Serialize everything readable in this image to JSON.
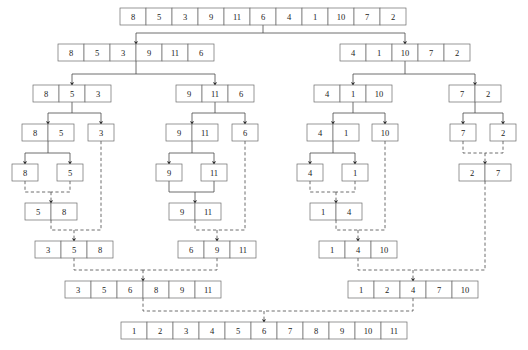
{
  "diagram": {
    "colors": {
      "box_stroke": "#6b6b6b",
      "line": "#4a4a4a",
      "text": "#1a1a1a",
      "background": "#ffffff"
    },
    "cell_width": 26,
    "cell_height": 17,
    "legend": {
      "split_style": "solid",
      "merge_style": "dashed"
    },
    "nodes": [
      {
        "id": "root",
        "phase": "split",
        "row": 0,
        "x": 120,
        "y": 8,
        "values": [
          8,
          5,
          3,
          9,
          11,
          6,
          4,
          1,
          10,
          7,
          2
        ]
      },
      {
        "id": "L",
        "phase": "split",
        "row": 1,
        "x": 58,
        "y": 44,
        "values": [
          8,
          5,
          3,
          9,
          11,
          6
        ]
      },
      {
        "id": "R",
        "phase": "split",
        "row": 1,
        "x": 340,
        "y": 44,
        "values": [
          4,
          1,
          10,
          7,
          2
        ]
      },
      {
        "id": "LL",
        "phase": "split",
        "row": 2,
        "x": 33,
        "y": 85,
        "values": [
          8,
          5,
          3
        ]
      },
      {
        "id": "LR",
        "phase": "split",
        "row": 2,
        "x": 176,
        "y": 85,
        "values": [
          9,
          11,
          6
        ]
      },
      {
        "id": "RL",
        "phase": "split",
        "row": 2,
        "x": 314,
        "y": 85,
        "values": [
          4,
          1,
          10
        ]
      },
      {
        "id": "RR",
        "phase": "split",
        "row": 2,
        "x": 449,
        "y": 85,
        "values": [
          7,
          2
        ]
      },
      {
        "id": "LLL",
        "phase": "split",
        "row": 3,
        "x": 22,
        "y": 124,
        "values": [
          8,
          5
        ]
      },
      {
        "id": "LLR",
        "phase": "split",
        "row": 3,
        "x": 88,
        "y": 124,
        "values": [
          3
        ]
      },
      {
        "id": "LRL",
        "phase": "split",
        "row": 3,
        "x": 166,
        "y": 124,
        "values": [
          9,
          11
        ]
      },
      {
        "id": "LRR",
        "phase": "split",
        "row": 3,
        "x": 232,
        "y": 124,
        "values": [
          6
        ]
      },
      {
        "id": "RLL",
        "phase": "split",
        "row": 3,
        "x": 307,
        "y": 124,
        "values": [
          4,
          1
        ]
      },
      {
        "id": "RLR",
        "phase": "split",
        "row": 3,
        "x": 372,
        "y": 124,
        "values": [
          10
        ]
      },
      {
        "id": "RRL",
        "phase": "split",
        "row": 3,
        "x": 450,
        "y": 124,
        "values": [
          7
        ]
      },
      {
        "id": "RRR",
        "phase": "split",
        "row": 3,
        "x": 490,
        "y": 124,
        "values": [
          2
        ]
      },
      {
        "id": "a8",
        "phase": "split",
        "row": 4,
        "x": 12,
        "y": 164,
        "values": [
          8
        ]
      },
      {
        "id": "a5",
        "phase": "split",
        "row": 4,
        "x": 57,
        "y": 164,
        "values": [
          5
        ]
      },
      {
        "id": "a9",
        "phase": "split",
        "row": 4,
        "x": 156,
        "y": 164,
        "values": [
          9
        ]
      },
      {
        "id": "a11",
        "phase": "split",
        "row": 4,
        "x": 201,
        "y": 164,
        "values": [
          11
        ]
      },
      {
        "id": "a4",
        "phase": "split",
        "row": 4,
        "x": 297,
        "y": 164,
        "values": [
          4
        ]
      },
      {
        "id": "a1",
        "phase": "split",
        "row": 4,
        "x": 342,
        "y": 164,
        "values": [
          1
        ]
      },
      {
        "id": "m27",
        "phase": "merge",
        "row": 4,
        "x": 459,
        "y": 164,
        "values": [
          2,
          7
        ]
      },
      {
        "id": "m58",
        "phase": "merge",
        "row": 5,
        "x": 25,
        "y": 203,
        "values": [
          5,
          8
        ]
      },
      {
        "id": "m911",
        "phase": "merge",
        "row": 5,
        "x": 169,
        "y": 203,
        "values": [
          9,
          11
        ]
      },
      {
        "id": "m14",
        "phase": "merge",
        "row": 5,
        "x": 310,
        "y": 203,
        "values": [
          1,
          4
        ]
      },
      {
        "id": "m358",
        "phase": "merge",
        "row": 6,
        "x": 35,
        "y": 241,
        "values": [
          3,
          5,
          8
        ]
      },
      {
        "id": "m6911",
        "phase": "merge",
        "row": 6,
        "x": 178,
        "y": 241,
        "values": [
          6,
          9,
          11
        ]
      },
      {
        "id": "m1410",
        "phase": "merge",
        "row": 6,
        "x": 319,
        "y": 241,
        "values": [
          1,
          4,
          10
        ]
      },
      {
        "id": "mleft",
        "phase": "merge",
        "row": 7,
        "x": 65,
        "y": 281,
        "values": [
          3,
          5,
          6,
          8,
          9,
          11
        ]
      },
      {
        "id": "mright",
        "phase": "merge",
        "row": 7,
        "x": 348,
        "y": 281,
        "values": [
          1,
          2,
          4,
          7,
          10
        ]
      },
      {
        "id": "final",
        "phase": "merge",
        "row": 8,
        "x": 121,
        "y": 322,
        "values": [
          1,
          2,
          3,
          4,
          5,
          6,
          7,
          8,
          9,
          10,
          11
        ]
      }
    ],
    "edges": [
      {
        "from": "root",
        "to": [
          "L",
          "R"
        ],
        "kind": "split"
      },
      {
        "from": "L",
        "to": [
          "LL",
          "LR"
        ],
        "kind": "split"
      },
      {
        "from": "R",
        "to": [
          "RL",
          "RR"
        ],
        "kind": "split"
      },
      {
        "from": "LL",
        "to": [
          "LLL",
          "LLR"
        ],
        "kind": "split"
      },
      {
        "from": "LR",
        "to": [
          "LRL",
          "LRR"
        ],
        "kind": "split"
      },
      {
        "from": "RL",
        "to": [
          "RLL",
          "RLR"
        ],
        "kind": "split"
      },
      {
        "from": "RR",
        "to": [
          "RRL",
          "RRR"
        ],
        "kind": "split"
      },
      {
        "from": "LLL",
        "to": [
          "a8",
          "a5"
        ],
        "kind": "split"
      },
      {
        "from": "LRL",
        "to": [
          "a9",
          "a11"
        ],
        "kind": "split"
      },
      {
        "from": "RLL",
        "to": [
          "a4",
          "a1"
        ],
        "kind": "split"
      },
      {
        "from": "merge-27",
        "to": [
          "m27"
        ],
        "kind": "merge"
      },
      {
        "from": "merge-58",
        "to": [
          "m58"
        ],
        "kind": "merge"
      },
      {
        "from": "merge-911",
        "to": [
          "m911"
        ],
        "kind": "split"
      },
      {
        "from": "merge-14",
        "to": [
          "m14"
        ],
        "kind": "merge"
      },
      {
        "from": "merge-358",
        "to": [
          "m358"
        ],
        "kind": "merge"
      },
      {
        "from": "merge-6911",
        "to": [
          "m6911"
        ],
        "kind": "merge"
      },
      {
        "from": "merge-1410",
        "to": [
          "m1410"
        ],
        "kind": "merge"
      },
      {
        "from": "merge-left",
        "to": [
          "mleft"
        ],
        "kind": "merge"
      },
      {
        "from": "merge-right",
        "to": [
          "mright"
        ],
        "kind": "merge"
      },
      {
        "from": "merge-final",
        "to": [
          "final"
        ],
        "kind": "merge"
      }
    ]
  }
}
